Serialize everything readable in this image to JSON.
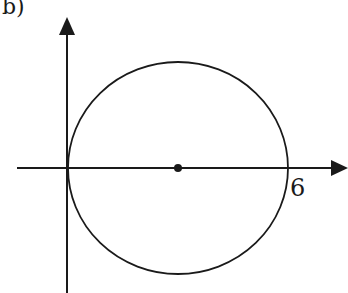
{
  "figure": {
    "part_label": "b)",
    "x_axis": {
      "tick_label": "6",
      "has_arrow": true
    },
    "y_axis": {
      "has_arrow": true
    },
    "circle": {
      "center": [
        3,
        0
      ],
      "radius": 3,
      "center_marked": true
    },
    "colors": {
      "stroke": "#1a1a1a",
      "background": "#ffffff"
    }
  }
}
